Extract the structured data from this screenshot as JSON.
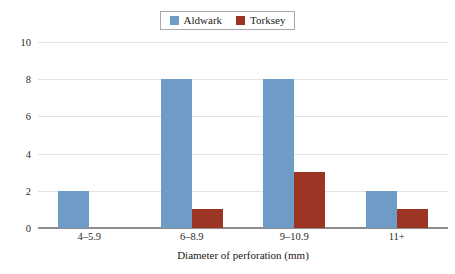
{
  "chart_data": {
    "type": "bar",
    "title": "",
    "xlabel": "Diameter of perforation (mm)",
    "ylabel": "",
    "categories": [
      "4–5.9",
      "6–8.9",
      "9–10.9",
      "11+"
    ],
    "series": [
      {
        "name": "Aldwark",
        "color": "#6f9bc7",
        "values": [
          2,
          8,
          8,
          2
        ]
      },
      {
        "name": "Torksey",
        "color": "#9c3524",
        "values": [
          0,
          1,
          3,
          1
        ]
      }
    ],
    "ylim": [
      0,
      10
    ],
    "yticks": [
      0,
      2,
      4,
      6,
      8,
      10
    ],
    "ytick_labels": [
      "0",
      "2",
      "4",
      "6",
      "8",
      "10"
    ],
    "grid": true,
    "legend_position": "top-center",
    "legend": [
      "Aldwark",
      "Torksey"
    ]
  },
  "legend": {
    "items": [
      {
        "label": "Aldwark",
        "swatch": "legend-swatch-aldwark"
      },
      {
        "label": "Torksey",
        "swatch": "legend-swatch-torksey"
      }
    ]
  },
  "axes": {
    "y_ticks": [
      "10",
      "8",
      "6",
      "4",
      "2",
      "0"
    ],
    "x_ticks": [
      "4–5.9",
      "6–8.9",
      "9–10.9",
      "11+"
    ],
    "x_title": "Diameter of perforation (mm)"
  },
  "colors": {
    "aldwark": "#6f9bc7",
    "torksey": "#9c3524",
    "gridline": "#e2e2e2",
    "axis": "#8d8d8d",
    "text": "#1a1a1a",
    "background": "#ffffff"
  }
}
